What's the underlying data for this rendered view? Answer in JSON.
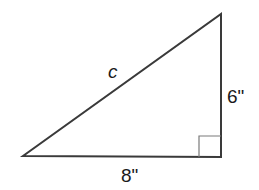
{
  "diagram": {
    "type": "right-triangle",
    "stroke_color": "#3a3a3a",
    "right_angle_marker_color": "#7a7a7a",
    "vertices": {
      "left": [
        23,
        156
      ],
      "right_angle": [
        221,
        157
      ],
      "top": [
        221,
        14
      ]
    },
    "labels": {
      "hypotenuse": "c",
      "vertical_side": "6\"",
      "horizontal_side": "8\""
    }
  }
}
